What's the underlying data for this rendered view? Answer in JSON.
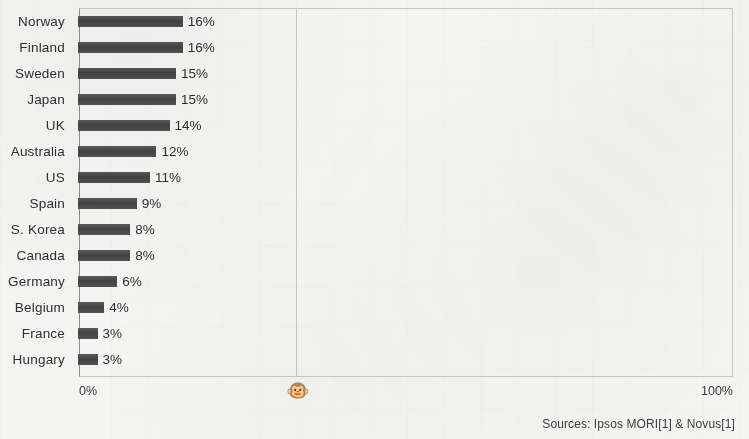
{
  "chart_data": {
    "type": "bar",
    "orientation": "horizontal",
    "title": "",
    "subtitle": "",
    "xlabel": "",
    "ylabel": "",
    "xlim": [
      0,
      100
    ],
    "xticks": [
      "0%",
      "100%"
    ],
    "grid": true,
    "gridlines_x": [
      33
    ],
    "legend": "none",
    "categories": [
      "Norway",
      "Finland",
      "Sweden",
      "Japan",
      "UK",
      "Australia",
      "US",
      "Spain",
      "S. Korea",
      "Canada",
      "Germany",
      "Belgium",
      "France",
      "Hungary"
    ],
    "values": [
      16,
      16,
      15,
      15,
      14,
      12,
      11,
      9,
      8,
      8,
      6,
      4,
      3,
      3
    ],
    "value_labels": [
      "16%",
      "16%",
      "15%",
      "15%",
      "14%",
      "12%",
      "11%",
      "9%",
      "8%",
      "8%",
      "6%",
      "4%",
      "3%",
      "3%"
    ],
    "bars": [
      {
        "label": "Norway",
        "value": 16,
        "value_label": "16%"
      },
      {
        "label": "Finland",
        "value": 16,
        "value_label": "16%"
      },
      {
        "label": "Sweden",
        "value": 15,
        "value_label": "15%"
      },
      {
        "label": "Japan",
        "value": 15,
        "value_label": "15%"
      },
      {
        "label": "UK",
        "value": 14,
        "value_label": "14%"
      },
      {
        "label": "Australia",
        "value": 12,
        "value_label": "12%"
      },
      {
        "label": "US",
        "value": 11,
        "value_label": "11%"
      },
      {
        "label": "Spain",
        "value": 9,
        "value_label": "9%"
      },
      {
        "label": "S. Korea",
        "value": 8,
        "value_label": "8%"
      },
      {
        "label": "Canada",
        "value": 8,
        "value_label": "8%"
      },
      {
        "label": "Germany",
        "value": 6,
        "value_label": "6%"
      },
      {
        "label": "Belgium",
        "value": 4,
        "value_label": "4%"
      },
      {
        "label": "France",
        "value": 3,
        "value_label": "3%"
      },
      {
        "label": "Hungary",
        "value": 3,
        "value_label": "3%"
      }
    ],
    "colors": {
      "bar": "#4c4c4c",
      "background": "#f4f4f3",
      "axis": "#8d8d8d",
      "grid": "#c9c9c9",
      "text": "#2f2f2f"
    },
    "annotations": [
      {
        "name": "monkey-marker",
        "glyph": "🐵",
        "x_percent": 33
      }
    ]
  },
  "axis": {
    "min_label": "0%",
    "max_label": "100%"
  },
  "footer": {
    "sources": "Sources: Ipsos MORI[1] & Novus[1]"
  },
  "icons": {
    "monkey": "🐵"
  }
}
